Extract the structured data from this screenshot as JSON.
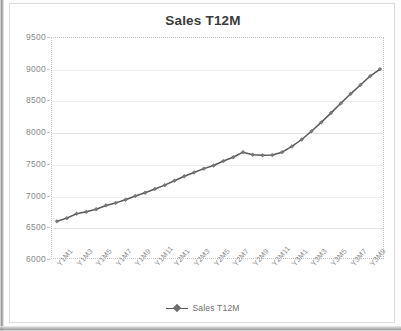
{
  "chart_data": {
    "type": "line",
    "title": "Sales T12M",
    "xlabel": "",
    "ylabel": "",
    "ylim": [
      6000,
      9500
    ],
    "ytick_step": 500,
    "yticks": [
      9500,
      9000,
      8500,
      8000,
      7500,
      7000,
      6500,
      6000
    ],
    "grid": true,
    "legend_position": "bottom",
    "legend_entries": [
      "Sales T12M"
    ],
    "marker": "diamond",
    "line_color": "#5a5a5a",
    "marker_color": "#7a7a7a",
    "xtick_labels": [
      "Y1M1",
      "Y1M3",
      "Y1M5",
      "Y1M7",
      "Y1M9",
      "Y1M11",
      "Y2M1",
      "Y2M3",
      "Y2M5",
      "Y2M7",
      "Y2M9",
      "Y2M11",
      "Y3M1",
      "Y3M3",
      "Y3M5",
      "Y3M7",
      "Y3M9"
    ],
    "x": [
      "Y1M1",
      "Y1M2",
      "Y1M3",
      "Y1M4",
      "Y1M5",
      "Y1M6",
      "Y1M7",
      "Y1M8",
      "Y1M9",
      "Y1M10",
      "Y1M11",
      "Y1M12",
      "Y2M1",
      "Y2M2",
      "Y2M3",
      "Y2M4",
      "Y2M5",
      "Y2M6",
      "Y2M7",
      "Y2M8",
      "Y2M9",
      "Y2M10",
      "Y2M11",
      "Y2M12",
      "Y3M1",
      "Y3M2",
      "Y3M3",
      "Y3M4",
      "Y3M5",
      "Y3M6",
      "Y3M7",
      "Y3M8",
      "Y3M9",
      "Y3M10"
    ],
    "series": [
      {
        "name": "Sales T12M",
        "values": [
          6610,
          6660,
          6730,
          6760,
          6800,
          6860,
          6900,
          6950,
          7010,
          7060,
          7120,
          7180,
          7250,
          7320,
          7380,
          7440,
          7490,
          7560,
          7620,
          7700,
          7660,
          7650,
          7655,
          7700,
          7790,
          7900,
          8030,
          8170,
          8320,
          8470,
          8620,
          8760,
          8900,
          9010
        ]
      }
    ]
  },
  "legend": {
    "label": "Sales T12M"
  }
}
